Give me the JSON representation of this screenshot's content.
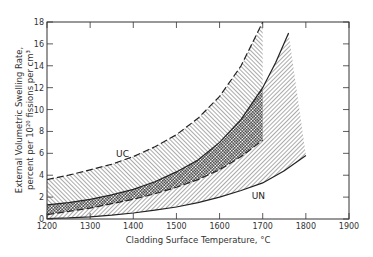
{
  "chart_data": {
    "type": "area",
    "title": "",
    "xlabel": "Cladding Surface Temperature, °C",
    "ylabel_line1": "External Volumetric Swelling Rate,",
    "ylabel_line2": "percent per 10²⁰ fissions per cm³",
    "xlim": [
      1200,
      1900
    ],
    "ylim": [
      0,
      18
    ],
    "x_ticks": [
      1200,
      1300,
      1400,
      1500,
      1600,
      1700,
      1800,
      1900
    ],
    "y_ticks": [
      0,
      2,
      4,
      6,
      8,
      10,
      12,
      14,
      16,
      18
    ],
    "grid": false,
    "bands": [
      {
        "name": "UC",
        "label": "UC",
        "label_position": {
          "x": 1375,
          "y": 5.7
        },
        "upper": {
          "style": "dashed",
          "x": [
            1200,
            1250,
            1300,
            1350,
            1400,
            1450,
            1500,
            1550,
            1600,
            1650,
            1700
          ],
          "y": [
            3.6,
            4.0,
            4.5,
            5.0,
            5.7,
            6.6,
            7.7,
            9.2,
            11.2,
            14.0,
            18.0
          ]
        },
        "lower": {
          "style": "dashed",
          "x": [
            1200,
            1250,
            1300,
            1350,
            1400,
            1450,
            1500,
            1550,
            1600,
            1650,
            1700
          ],
          "y": [
            0.4,
            0.7,
            1.0,
            1.4,
            1.8,
            2.3,
            2.9,
            3.6,
            4.5,
            5.7,
            7.2
          ]
        },
        "x_end": 1700,
        "hatch": "dense-diagonal"
      },
      {
        "name": "UN",
        "label": "UN",
        "label_position": {
          "x": 1690,
          "y": 1.8
        },
        "upper": {
          "style": "solid",
          "x": [
            1200,
            1250,
            1300,
            1350,
            1400,
            1450,
            1500,
            1550,
            1600,
            1650,
            1700,
            1730,
            1760
          ],
          "y": [
            1.3,
            1.5,
            1.8,
            2.2,
            2.7,
            3.4,
            4.3,
            5.4,
            7.0,
            9.1,
            12.0,
            14.3,
            17.0
          ]
        },
        "lower": {
          "style": "solid",
          "x": [
            1200,
            1250,
            1300,
            1350,
            1400,
            1450,
            1500,
            1550,
            1600,
            1650,
            1700,
            1750,
            1800
          ],
          "y": [
            0.05,
            0.1,
            0.2,
            0.35,
            0.55,
            0.8,
            1.1,
            1.5,
            2.0,
            2.6,
            3.3,
            4.4,
            5.8
          ]
        },
        "x_end": 1800,
        "hatch": "diagonal"
      }
    ],
    "overlap_region": {
      "description": "cross-hatched overlap between UC and UN bands",
      "hatch": "crosshatch"
    }
  },
  "colors": {
    "line": "#222222",
    "frame": "#333333",
    "background": "#ffffff"
  }
}
